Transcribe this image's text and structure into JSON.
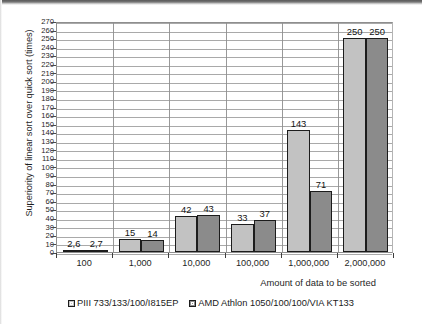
{
  "chart_data": {
    "type": "bar",
    "title": "",
    "subtitle": "",
    "xlabel": "Amount of data to be sorted",
    "ylabel": "Superiority of linear sort over quick sort (times)",
    "categories": [
      "100",
      "1,000",
      "10,000",
      "100,000",
      "1,000,000",
      "2,000,000"
    ],
    "series": [
      {
        "name": "PIII 733/133/100/I815EP",
        "color": "#c2c2c2",
        "values": [
          2.6,
          15,
          42,
          33,
          143,
          250
        ],
        "labels": [
          "2,6",
          "15",
          "42",
          "33",
          "143",
          "250"
        ]
      },
      {
        "name": "AMD Athlon 1050/100/100/VIA KT133",
        "color": "#8b8b8b",
        "values": [
          2.7,
          14,
          43,
          37,
          71,
          250
        ],
        "labels": [
          "2,7",
          "14",
          "43",
          "37",
          "71",
          "250"
        ]
      }
    ],
    "ylim": [
      0,
      270
    ],
    "ytick_step": 10,
    "yticks": [
      0,
      10,
      20,
      30,
      40,
      50,
      60,
      70,
      80,
      90,
      100,
      110,
      120,
      130,
      140,
      150,
      160,
      170,
      180,
      190,
      200,
      210,
      220,
      230,
      240,
      250,
      260,
      270
    ],
    "grid": true,
    "grid_axis": "both",
    "legend_position": "bottom"
  },
  "legend": {
    "entries": [
      {
        "label": "PIII 733/133/100/I815EP"
      },
      {
        "label": "AMD Athlon 1050/100/100/VIA KT133"
      }
    ]
  }
}
